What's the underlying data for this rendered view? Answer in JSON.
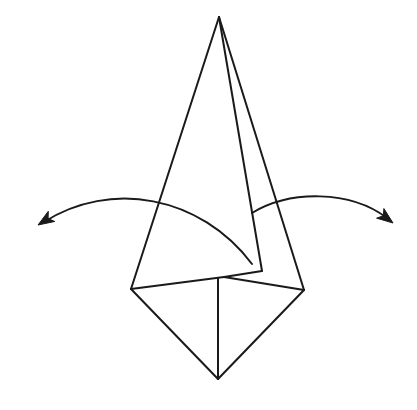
{
  "diagram": {
    "type": "origami-fold-step",
    "colors": {
      "background": "#ffffff",
      "stroke": "#1a1a1a"
    },
    "vertices": {
      "apex": [
        219,
        17
      ],
      "left": [
        131,
        289
      ],
      "right": [
        304,
        290
      ],
      "bottom": [
        218,
        379
      ],
      "center_top": [
        218,
        278
      ],
      "flap_corner": [
        262,
        271
      ],
      "flap_return": [
        224,
        277
      ]
    },
    "edges": [
      {
        "name": "left-outer-edge",
        "from": "apex",
        "to": "left"
      },
      {
        "name": "right-outer-edge",
        "from": "apex",
        "to": "right"
      },
      {
        "name": "inner-flap-edge",
        "from": "apex",
        "to": "flap_corner"
      },
      {
        "name": "flap-bottom-edge",
        "from": "flap_corner",
        "to": "flap_return"
      },
      {
        "name": "left-base-edge",
        "from": "left",
        "to": "flap_return"
      },
      {
        "name": "right-base-edge",
        "from": "flap_return",
        "to": "right"
      },
      {
        "name": "lower-left-edge",
        "from": "left",
        "to": "bottom"
      },
      {
        "name": "lower-right-edge",
        "from": "right",
        "to": "bottom"
      },
      {
        "name": "center-crease",
        "from": "center_top",
        "to": "bottom"
      }
    ],
    "arrows": [
      {
        "name": "left-fold-arrow",
        "direction": "outward-left",
        "start": [
          252,
          264
        ],
        "control1": [
          200,
          195
        ],
        "control2": [
          110,
          180
        ],
        "end": [
          44,
          222
        ],
        "tip": [
          38,
          225
        ]
      },
      {
        "name": "right-fold-arrow",
        "direction": "outward-right",
        "start": [
          252,
          213
        ],
        "control1": [
          290,
          190
        ],
        "control2": [
          350,
          190
        ],
        "end": [
          387,
          218
        ],
        "tip": [
          393,
          223
        ]
      }
    ],
    "labels": {
      "title": "Fold the side flaps outward"
    }
  }
}
